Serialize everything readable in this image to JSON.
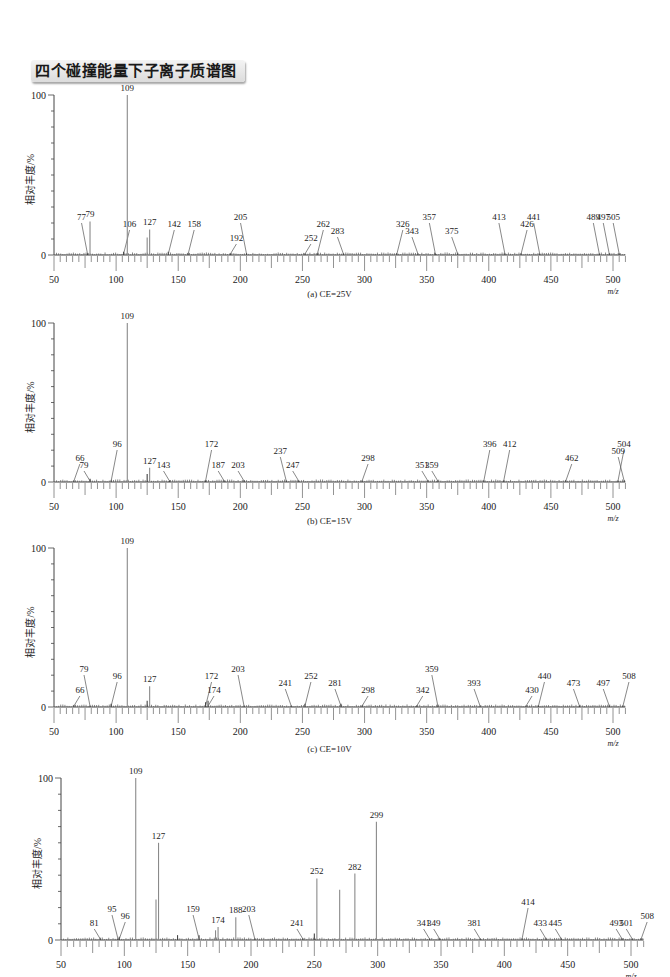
{
  "page_title": "四个碰撞能量下子离子质谱图",
  "colors": {
    "peak": "#8a8a8a",
    "axis": "#444444",
    "text": "#222222"
  },
  "chart_data": [
    {
      "type": "bar",
      "panel": "a",
      "caption": "(a) CE=25V",
      "xlabel": "m/z",
      "ylabel": "相对丰度/%",
      "xlim": [
        50,
        510
      ],
      "ylim": [
        0,
        100
      ],
      "xticks": [
        50,
        100,
        150,
        200,
        250,
        300,
        350,
        400,
        450,
        500
      ],
      "yticks": [
        "0",
        "100"
      ],
      "grid": false,
      "peaks": [
        {
          "mz": 77,
          "intensity": 1,
          "label": "77"
        },
        {
          "mz": 79,
          "intensity": 21,
          "label": "79"
        },
        {
          "mz": 106,
          "intensity": 2,
          "label": "106"
        },
        {
          "mz": 109,
          "intensity": 100,
          "label": "109"
        },
        {
          "mz": 125,
          "intensity": 11,
          "label": ""
        },
        {
          "mz": 127,
          "intensity": 16,
          "label": "127"
        },
        {
          "mz": 142,
          "intensity": 2,
          "label": "142"
        },
        {
          "mz": 158,
          "intensity": 1,
          "label": "158"
        },
        {
          "mz": 192,
          "intensity": 1,
          "label": "192"
        },
        {
          "mz": 205,
          "intensity": 1,
          "label": "205"
        },
        {
          "mz": 252,
          "intensity": 1,
          "label": "252"
        },
        {
          "mz": 262,
          "intensity": 1,
          "label": "262"
        },
        {
          "mz": 283,
          "intensity": 1,
          "label": "283"
        },
        {
          "mz": 326,
          "intensity": 1,
          "label": "326"
        },
        {
          "mz": 343,
          "intensity": 1,
          "label": "343"
        },
        {
          "mz": 357,
          "intensity": 1,
          "label": "357"
        },
        {
          "mz": 375,
          "intensity": 1,
          "label": "375"
        },
        {
          "mz": 413,
          "intensity": 1,
          "label": "413"
        },
        {
          "mz": 426,
          "intensity": 1,
          "label": "426"
        },
        {
          "mz": 441,
          "intensity": 1,
          "label": "441"
        },
        {
          "mz": 489,
          "intensity": 1,
          "label": "489"
        },
        {
          "mz": 497,
          "intensity": 1,
          "label": "497"
        },
        {
          "mz": 505,
          "intensity": 1,
          "label": "505"
        }
      ]
    },
    {
      "type": "bar",
      "panel": "b",
      "caption": "(b) CE=15V",
      "xlabel": "m/z",
      "ylabel": "相对丰度/%",
      "xlim": [
        50,
        510
      ],
      "ylim": [
        0,
        100
      ],
      "xticks": [
        50,
        100,
        150,
        200,
        250,
        300,
        350,
        400,
        450,
        500
      ],
      "yticks": [
        "0",
        "100"
      ],
      "grid": false,
      "peaks": [
        {
          "mz": 66,
          "intensity": 1,
          "label": "66"
        },
        {
          "mz": 79,
          "intensity": 2,
          "label": "79"
        },
        {
          "mz": 96,
          "intensity": 1,
          "label": "96"
        },
        {
          "mz": 109,
          "intensity": 100,
          "label": "109"
        },
        {
          "mz": 125,
          "intensity": 5,
          "label": ""
        },
        {
          "mz": 127,
          "intensity": 9,
          "label": "127"
        },
        {
          "mz": 143,
          "intensity": 1,
          "label": "143"
        },
        {
          "mz": 172,
          "intensity": 1,
          "label": "172"
        },
        {
          "mz": 187,
          "intensity": 1,
          "label": "187"
        },
        {
          "mz": 203,
          "intensity": 1,
          "label": "203"
        },
        {
          "mz": 237,
          "intensity": 1,
          "label": "237"
        },
        {
          "mz": 247,
          "intensity": 1,
          "label": "247"
        },
        {
          "mz": 298,
          "intensity": 1,
          "label": "298"
        },
        {
          "mz": 351,
          "intensity": 1,
          "label": "351"
        },
        {
          "mz": 359,
          "intensity": 1,
          "label": "359"
        },
        {
          "mz": 396,
          "intensity": 1,
          "label": "396"
        },
        {
          "mz": 412,
          "intensity": 1,
          "label": "412"
        },
        {
          "mz": 462,
          "intensity": 1,
          "label": "462"
        },
        {
          "mz": 504,
          "intensity": 1,
          "label": "504"
        },
        {
          "mz": 509,
          "intensity": 1,
          "label": "509"
        }
      ]
    },
    {
      "type": "bar",
      "panel": "c",
      "caption": "(c) CE=10V",
      "xlabel": "m/z",
      "ylabel": "相对丰度/%",
      "xlim": [
        50,
        510
      ],
      "ylim": [
        0,
        100
      ],
      "xticks": [
        50,
        100,
        150,
        200,
        250,
        300,
        350,
        400,
        450,
        500
      ],
      "yticks": [
        "0",
        "100"
      ],
      "grid": false,
      "peaks": [
        {
          "mz": 66,
          "intensity": 1,
          "label": "66"
        },
        {
          "mz": 79,
          "intensity": 1,
          "label": "79"
        },
        {
          "mz": 96,
          "intensity": 2,
          "label": "96"
        },
        {
          "mz": 109,
          "intensity": 100,
          "label": "109"
        },
        {
          "mz": 125,
          "intensity": 4,
          "label": ""
        },
        {
          "mz": 127,
          "intensity": 13,
          "label": "127"
        },
        {
          "mz": 172,
          "intensity": 3,
          "label": "172"
        },
        {
          "mz": 174,
          "intensity": 4,
          "label": "174"
        },
        {
          "mz": 203,
          "intensity": 1,
          "label": "203"
        },
        {
          "mz": 241,
          "intensity": 1,
          "label": "241"
        },
        {
          "mz": 252,
          "intensity": 2,
          "label": "252"
        },
        {
          "mz": 281,
          "intensity": 2,
          "label": "281"
        },
        {
          "mz": 298,
          "intensity": 1,
          "label": "298"
        },
        {
          "mz": 342,
          "intensity": 1,
          "label": "342"
        },
        {
          "mz": 359,
          "intensity": 1,
          "label": "359"
        },
        {
          "mz": 393,
          "intensity": 1,
          "label": "393"
        },
        {
          "mz": 430,
          "intensity": 1,
          "label": "430"
        },
        {
          "mz": 440,
          "intensity": 1,
          "label": "440"
        },
        {
          "mz": 473,
          "intensity": 1,
          "label": "473"
        },
        {
          "mz": 497,
          "intensity": 1,
          "label": "497"
        },
        {
          "mz": 508,
          "intensity": 1,
          "label": "508"
        }
      ]
    },
    {
      "type": "bar",
      "panel": "d",
      "caption": "",
      "xlabel": "m/z",
      "ylabel": "相对丰度/%",
      "xlim": [
        50,
        510
      ],
      "ylim": [
        0,
        100
      ],
      "xticks": [
        50,
        100,
        150,
        200,
        250,
        300,
        350,
        400,
        450,
        500
      ],
      "yticks": [
        "0",
        "100"
      ],
      "grid": false,
      "peaks": [
        {
          "mz": 81,
          "intensity": 1,
          "label": "81"
        },
        {
          "mz": 95,
          "intensity": 1,
          "label": "95"
        },
        {
          "mz": 96,
          "intensity": 2,
          "label": "96"
        },
        {
          "mz": 109,
          "intensity": 100,
          "label": "109"
        },
        {
          "mz": 125,
          "intensity": 25,
          "label": ""
        },
        {
          "mz": 127,
          "intensity": 60,
          "label": "127"
        },
        {
          "mz": 142,
          "intensity": 3,
          "label": ""
        },
        {
          "mz": 159,
          "intensity": 3,
          "label": "159"
        },
        {
          "mz": 172,
          "intensity": 6,
          "label": ""
        },
        {
          "mz": 174,
          "intensity": 8,
          "label": "174"
        },
        {
          "mz": 188,
          "intensity": 14,
          "label": "188"
        },
        {
          "mz": 203,
          "intensity": 1,
          "label": "203"
        },
        {
          "mz": 241,
          "intensity": 1,
          "label": "241"
        },
        {
          "mz": 250,
          "intensity": 4,
          "label": ""
        },
        {
          "mz": 252,
          "intensity": 38,
          "label": "252"
        },
        {
          "mz": 270,
          "intensity": 31,
          "label": ""
        },
        {
          "mz": 282,
          "intensity": 41,
          "label": "282"
        },
        {
          "mz": 299,
          "intensity": 73,
          "label": "299"
        },
        {
          "mz": 341,
          "intensity": 1,
          "label": "341"
        },
        {
          "mz": 349,
          "intensity": 1,
          "label": "349"
        },
        {
          "mz": 381,
          "intensity": 1,
          "label": "381"
        },
        {
          "mz": 414,
          "intensity": 1,
          "label": "414"
        },
        {
          "mz": 433,
          "intensity": 1,
          "label": "433"
        },
        {
          "mz": 445,
          "intensity": 1,
          "label": "445"
        },
        {
          "mz": 493,
          "intensity": 1,
          "label": "493"
        },
        {
          "mz": 501,
          "intensity": 1,
          "label": "501"
        },
        {
          "mz": 508,
          "intensity": 1,
          "label": "508"
        }
      ]
    }
  ]
}
